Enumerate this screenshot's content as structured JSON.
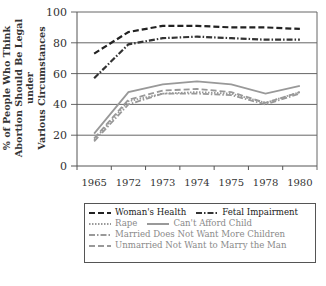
{
  "chart_data": {
    "type": "line",
    "title": "",
    "xlabel": "",
    "ylabel": "% of People Who Think Abortion Should Be Legal under Various Circumstances",
    "ylabel_lines": [
      "% of People Who Think",
      "Abortion Should Be Legal under",
      "Various Circumstances"
    ],
    "ylim": [
      0,
      100
    ],
    "yticks": [
      0,
      20,
      40,
      60,
      80,
      100
    ],
    "grid": true,
    "legend_position": "bottom",
    "categories": [
      "1965",
      "1972",
      "1973",
      "1974",
      "1975",
      "1978",
      "1980"
    ],
    "series": [
      {
        "name": "Woman's Health",
        "style": "dashed",
        "color": "#222222",
        "values": [
          73,
          87,
          91,
          91,
          90,
          90,
          89
        ]
      },
      {
        "name": "Fetal Impairment",
        "style": "dash-dot",
        "color": "#333333",
        "values": [
          57,
          79,
          83,
          84,
          83,
          82,
          82
        ]
      },
      {
        "name": "Rape",
        "style": "dotted",
        "color": "#999999",
        "values": [
          17,
          42,
          47,
          48,
          47,
          41,
          48
        ]
      },
      {
        "name": "Can't Afford Child",
        "style": "solid",
        "color": "#999999",
        "values": [
          21,
          48,
          53,
          55,
          53,
          47,
          52
        ]
      },
      {
        "name": "Married Does Not Want More Children",
        "style": "dash-dot",
        "color": "#999999",
        "values": [
          16,
          40,
          47,
          47,
          46,
          40,
          47
        ]
      },
      {
        "name": "Unmarried Not Want to Marry the Man",
        "style": "dashed",
        "color": "#999999",
        "values": [
          18,
          43,
          49,
          50,
          48,
          41,
          48
        ]
      }
    ]
  },
  "legend": {
    "rows": [
      [
        {
          "label": "Woman's Health",
          "series": 0
        },
        {
          "label": "Fetal Impairment",
          "series": 1
        }
      ],
      [
        {
          "label": "Rape",
          "series": 2
        },
        {
          "label": "Can't Afford Child",
          "series": 3
        }
      ],
      [
        {
          "label": "Married Does Not Want More Children",
          "series": 4
        }
      ],
      [
        {
          "label": "Unmarried Not Want to Marry the Man",
          "series": 5
        }
      ]
    ]
  }
}
